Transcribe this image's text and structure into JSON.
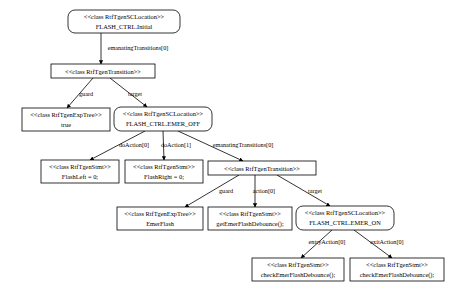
{
  "diagram": {
    "type": "object-graph",
    "stereotype_open": "<<",
    "stereotype_close": ">>",
    "nodes": [
      {
        "id": "n0",
        "shape": "rounded-rect",
        "stereotype": "<<class RtfTgenSCLocation>>",
        "label": "FLASH_CTRL.Initial",
        "x": 68,
        "y": 10,
        "w": 112,
        "h": 23
      },
      {
        "id": "n1",
        "shape": "rect",
        "stereotype": "<<class RtfTgenTransition>>",
        "label": "",
        "x": 51,
        "y": 64,
        "w": 104,
        "h": 14
      },
      {
        "id": "n2",
        "shape": "rect",
        "stereotype": "<<class RtfTgenExpTree>>",
        "label": "true",
        "x": 22,
        "y": 108,
        "w": 88,
        "h": 23
      },
      {
        "id": "n3",
        "shape": "rounded-rect",
        "stereotype": "<<class RtfTgenSCLocation>>",
        "label": "FLASH_CTRL.EMER_OFF",
        "x": 114,
        "y": 107,
        "w": 98,
        "h": 24
      },
      {
        "id": "n4",
        "shape": "rect",
        "stereotype": "<<class RtfTgenStmt>>",
        "label": "FlashLeft = 0;",
        "x": 41,
        "y": 160,
        "w": 78,
        "h": 23
      },
      {
        "id": "n5",
        "shape": "rect",
        "stereotype": "<<class RtfTgenStmt>>",
        "label": "FlashRight = 0;",
        "x": 125,
        "y": 160,
        "w": 78,
        "h": 23
      },
      {
        "id": "n6",
        "shape": "rect",
        "stereotype": "<<class RtfTgenTransition>>",
        "label": "",
        "x": 208,
        "y": 161,
        "w": 108,
        "h": 14
      },
      {
        "id": "n7",
        "shape": "rect",
        "stereotype": "<<class RtfTgenExpTree>>",
        "label": "EmerFlash",
        "x": 117,
        "y": 207,
        "w": 86,
        "h": 23
      },
      {
        "id": "n8",
        "shape": "rect",
        "stereotype": "<<class RtfTgenStmt>>",
        "label": "getEmerFlashDebounce();",
        "x": 208,
        "y": 207,
        "w": 84,
        "h": 23
      },
      {
        "id": "n9",
        "shape": "rounded-rect",
        "stereotype": "<<class RtfTgenSCLocation>>",
        "label": "FLASH_CTRL.EMER_ON",
        "x": 296,
        "y": 206,
        "w": 98,
        "h": 24
      },
      {
        "id": "n10",
        "shape": "rect",
        "stereotype": "<<class RtfTgenStmt>>",
        "label": "checkEmerFlashDebounce();",
        "x": 252,
        "y": 258,
        "w": 92,
        "h": 23
      },
      {
        "id": "n11",
        "shape": "rect",
        "stereotype": "<<class RtfTgenStmt>>",
        "label": "checkEmerFlashDebounce();",
        "x": 350,
        "y": 258,
        "w": 94,
        "h": 23
      }
    ],
    "edges": [
      {
        "id": "e0",
        "from": "n0",
        "to": "n1",
        "label": "emanatingTransitions[0]",
        "lx": 138,
        "ly": 50,
        "x1": 101,
        "y1": 33,
        "x2": 101,
        "y2": 64
      },
      {
        "id": "e1",
        "from": "n1",
        "to": "n2",
        "label": "guard",
        "lx": 86,
        "ly": 96,
        "x1": 93,
        "y1": 78,
        "x2": 67,
        "y2": 108
      },
      {
        "id": "e2",
        "from": "n1",
        "to": "n3",
        "label": "target",
        "lx": 135,
        "ly": 96,
        "x1": 110,
        "y1": 78,
        "x2": 147,
        "y2": 107
      },
      {
        "id": "e3",
        "from": "n3",
        "to": "n4",
        "label": "doAction[0]",
        "lx": 134,
        "ly": 147,
        "x1": 145,
        "y1": 131,
        "x2": 90,
        "y2": 160
      },
      {
        "id": "e4",
        "from": "n3",
        "to": "n5",
        "label": "doAction[1]",
        "lx": 176,
        "ly": 147,
        "x1": 163,
        "y1": 131,
        "x2": 164,
        "y2": 160
      },
      {
        "id": "e5",
        "from": "n3",
        "to": "n6",
        "label": "emanatingTransitions[0]",
        "lx": 243,
        "ly": 147,
        "x1": 178,
        "y1": 131,
        "x2": 243,
        "y2": 161
      },
      {
        "id": "e6",
        "from": "n6",
        "to": "n7",
        "label": "guard",
        "lx": 226,
        "ly": 193,
        "x1": 239,
        "y1": 175,
        "x2": 185,
        "y2": 207
      },
      {
        "id": "e7",
        "from": "n6",
        "to": "n8",
        "label": "action[0]",
        "lx": 264,
        "ly": 193,
        "x1": 255,
        "y1": 175,
        "x2": 255,
        "y2": 207
      },
      {
        "id": "e8",
        "from": "n6",
        "to": "n9",
        "label": "target",
        "lx": 315,
        "ly": 193,
        "x1": 277,
        "y1": 175,
        "x2": 330,
        "y2": 206
      },
      {
        "id": "e9",
        "from": "n9",
        "to": "n10",
        "label": "entryAction[0]",
        "lx": 327,
        "ly": 244,
        "x1": 332,
        "y1": 230,
        "x2": 301,
        "y2": 258
      },
      {
        "id": "e10",
        "from": "n9",
        "to": "n11",
        "label": "exitAction[0]",
        "lx": 387,
        "ly": 244,
        "x1": 354,
        "y1": 230,
        "x2": 392,
        "y2": 258
      }
    ]
  }
}
